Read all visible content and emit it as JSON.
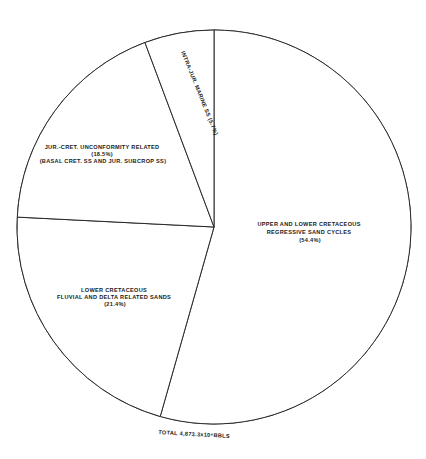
{
  "chart_data": {
    "type": "pie",
    "title": "",
    "total_label": "TOTAL 4,873.3x10⁶BBLS",
    "start_angle_deg": 0,
    "direction": "clockwise",
    "slices": [
      {
        "id": "upper-lower-cret",
        "label_lines": [
          "UPPER AND LOWER CRETACEOUS",
          "REGRESSIVE SAND CYCLES",
          "(54.4%)"
        ],
        "label": "Upper and Lower Cretaceous Regressive Sand Cycles",
        "value": 54.4
      },
      {
        "id": "lower-cret-fluvial",
        "label_lines": [
          "LOWER CRETACEOUS",
          "FLUVIAL AND DELTA RELATED SANDS",
          "(21.4%)"
        ],
        "label": "Lower Cretaceous Fluvial and Delta Related Sands",
        "value": 21.4
      },
      {
        "id": "jur-cret-unconformity",
        "label_lines": [
          "JUR.-CRET. UNCONFORMITY RELATED",
          "(18.5%)",
          "(BASAL CRET. SS AND JUR. SUBCROP SS)"
        ],
        "label": "Jur.-Cret. Unconformity Related (Basal Cret. SS and Jur. Subcrop SS)",
        "value": 18.5
      },
      {
        "id": "intra-jur-marine",
        "label_lines": [
          "INTRA-JUR. MARINE SS (5.7%)"
        ],
        "label": "Intra-Jur. Marine SS",
        "value": 5.7
      }
    ],
    "colors": {
      "fill": "#ffffff",
      "stroke": "#2a2a2a",
      "text": "#1a1a1a"
    }
  }
}
